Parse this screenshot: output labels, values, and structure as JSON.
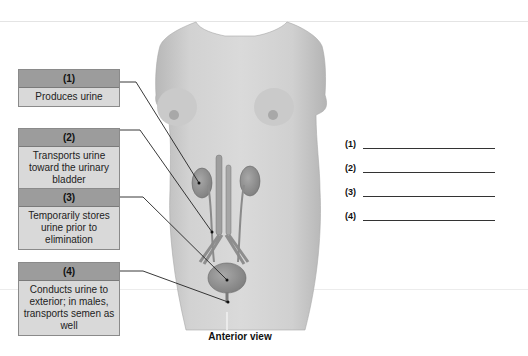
{
  "figure": {
    "caption": "Anterior view",
    "labels": [
      {
        "number": "(1)",
        "description": "Produces urine",
        "structure": "kidney"
      },
      {
        "number": "(2)",
        "description": "Transports urine toward the urinary bladder",
        "structure": "ureter"
      },
      {
        "number": "(3)",
        "description": "Temporarily stores urine prior to elimination",
        "structure": "urinary-bladder"
      },
      {
        "number": "(4)",
        "description": "Conducts urine to exterior; in males, transports semen as well",
        "structure": "urethra"
      }
    ],
    "answer_blanks": [
      {
        "number": "(1)",
        "value": ""
      },
      {
        "number": "(2)",
        "value": ""
      },
      {
        "number": "(3)",
        "value": ""
      },
      {
        "number": "(4)",
        "value": ""
      }
    ]
  },
  "colors": {
    "label_header": "#9c9c9c",
    "label_body": "#d9d9d9",
    "skin": "#cfcfcf",
    "organ": "#8f8f8f",
    "leader_line": "#222222"
  }
}
